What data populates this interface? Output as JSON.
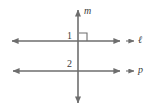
{
  "figure": {
    "background_color": "#ffffff",
    "stroke_color": "#6e6e6e",
    "text_color": "#3b3b3b",
    "width": 161,
    "height": 112,
    "lines": [
      {
        "id": "m",
        "name": "m",
        "orientation": "vertical",
        "label": "m",
        "label_style": "italic",
        "x": 78,
        "y1": 10,
        "y2": 103,
        "arrow_start": true,
        "arrow_end": true
      },
      {
        "id": "l",
        "name": "ell",
        "orientation": "horizontal",
        "label": "ℓ",
        "label_style": "italic",
        "y": 41,
        "x1": 12,
        "x2": 120,
        "arrow_start": true,
        "arrow_end": true
      },
      {
        "id": "p",
        "name": "p",
        "orientation": "horizontal",
        "label": "p",
        "label_style": "italic",
        "y": 71,
        "x1": 13,
        "x2": 120,
        "arrow_start": true,
        "arrow_end": true
      }
    ],
    "pointers": [
      {
        "id": "pointer-ell",
        "x1": 126,
        "x2": 134,
        "y": 41
      },
      {
        "id": "pointer-p",
        "x1": 126,
        "x2": 134,
        "y": 71
      }
    ],
    "angles": [
      {
        "id": "angle-1",
        "label": "1",
        "x": 67,
        "y": 31,
        "at": "above-left of m-and-l intersection"
      },
      {
        "id": "angle-2",
        "label": "2",
        "x": 67,
        "y": 59,
        "at": "above-left of m-and-p intersection"
      }
    ],
    "right_angle_marker": {
      "id": "right-angle-marker",
      "present": true,
      "x": 79,
      "y": 33,
      "size": 8,
      "quadrant": "upper-right of m and l intersection"
    }
  }
}
